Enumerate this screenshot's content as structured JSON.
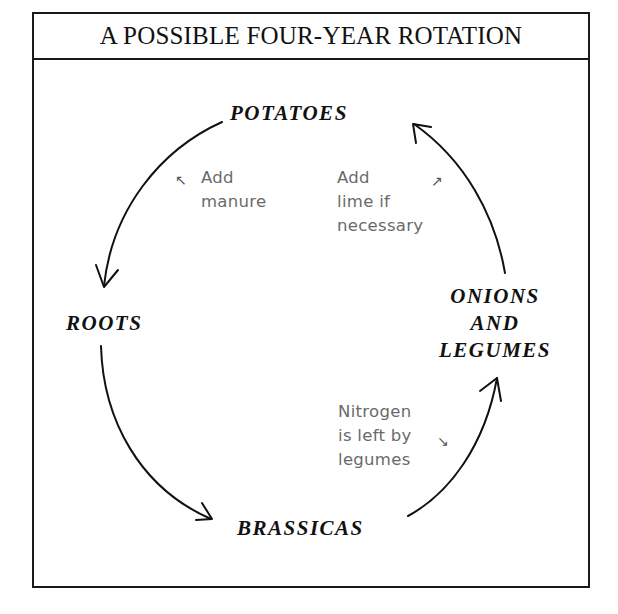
{
  "title": "A POSSIBLE FOUR-YEAR ROTATION",
  "crops": {
    "potatoes": "POTATOES",
    "roots": "ROOTS",
    "onions_legumes": [
      "ONIONS",
      "AND",
      "LEGUMES"
    ],
    "brassicas": "BRASSICAS"
  },
  "notes": {
    "manure": {
      "lines": [
        "Add",
        "manure"
      ],
      "arrow": "↖"
    },
    "lime": {
      "lines": [
        "Add",
        "lime if",
        "necessary"
      ],
      "arrow": "↗"
    },
    "nitrogen": {
      "lines": [
        "Nitrogen",
        "is left by",
        "legumes"
      ],
      "arrow": "↘"
    }
  },
  "cycle_order": [
    "POTATOES",
    "ROOTS",
    "BRASSICAS",
    "ONIONS AND LEGUMES"
  ],
  "colors": {
    "ink": "#111111",
    "note_gray": "#6a6a6a",
    "background": "#ffffff"
  }
}
